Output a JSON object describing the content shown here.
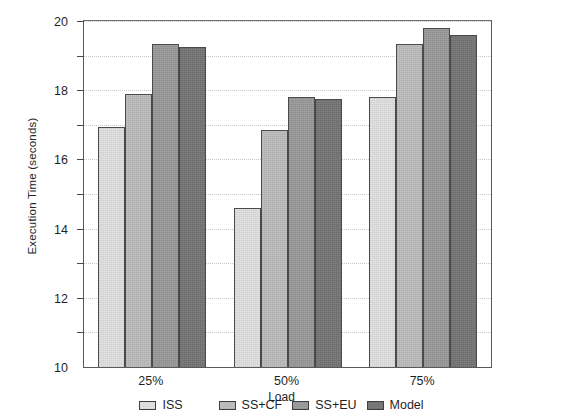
{
  "chart_data": {
    "type": "bar",
    "title": "",
    "xlabel": "Load",
    "ylabel": "Execution Time (seconds)",
    "categories": [
      "25%",
      "50%",
      "75%"
    ],
    "series": [
      {
        "name": "ISS",
        "values": [
          13.9,
          9.2,
          15.6
        ],
        "color": "#e2e2e2"
      },
      {
        "name": "SS+CF",
        "values": [
          15.8,
          13.7,
          18.7
        ],
        "color": "#bdbdbd"
      },
      {
        "name": "SS+EU",
        "values": [
          18.7,
          15.6,
          19.6
        ],
        "color": "#9a9a9a"
      },
      {
        "name": "Model",
        "values": [
          18.5,
          15.5,
          19.2
        ],
        "color": "#757575"
      }
    ],
    "ylim": [
      0,
      20
    ],
    "yticks": [
      2,
      4,
      6,
      8,
      10,
      12,
      14,
      16,
      18,
      20
    ],
    "ytick_labels": [
      "2",
      "4",
      "6",
      "8",
      "10",
      "12",
      "14",
      "16",
      "18",
      "20"
    ],
    "grid": true,
    "grid_axis": "y",
    "legend_position": "bottom",
    "bar_border_color": "#4b4b4b",
    "axis_color": "#5a5a5a"
  }
}
